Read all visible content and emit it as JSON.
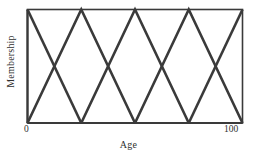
{
  "figure": {
    "background": "#ffffff",
    "line_color": "#3a3a3a",
    "frame_color": "#3a3a3a"
  },
  "axes": {
    "xlabel": "Age",
    "ylabel": "Membership",
    "x_tick_min_label": "0",
    "x_tick_max_label": "100"
  },
  "chart_data": {
    "type": "line",
    "title": "",
    "xlabel": "Age",
    "ylabel": "Membership",
    "xlim": [
      0,
      100
    ],
    "ylim": [
      0,
      1
    ],
    "grid": false,
    "legend": "none",
    "x_ticks": [
      0,
      100
    ],
    "x_tick_labels": [
      "0",
      "100"
    ],
    "y_ticks": [],
    "y_tick_labels": [],
    "series": [
      {
        "name": "set-1",
        "x": [
          0,
          25
        ],
        "values": [
          1,
          0
        ]
      },
      {
        "name": "set-2",
        "x": [
          0,
          25,
          50
        ],
        "values": [
          0,
          1,
          0
        ]
      },
      {
        "name": "set-3",
        "x": [
          25,
          50,
          75
        ],
        "values": [
          0,
          1,
          0
        ]
      },
      {
        "name": "set-4",
        "x": [
          50,
          75,
          100
        ],
        "values": [
          0,
          1,
          0
        ]
      },
      {
        "name": "set-5",
        "x": [
          75,
          100
        ],
        "values": [
          0,
          1
        ]
      }
    ],
    "peaks": [
      0,
      25,
      50,
      75,
      100
    ],
    "zero_crossings": [
      0,
      25,
      50,
      75,
      100
    ],
    "intersection_points": [
      {
        "x": 12.5,
        "y": 0.5
      },
      {
        "x": 37.5,
        "y": 0.5
      },
      {
        "x": 62.5,
        "y": 0.5
      },
      {
        "x": 87.5,
        "y": 0.5
      }
    ]
  }
}
